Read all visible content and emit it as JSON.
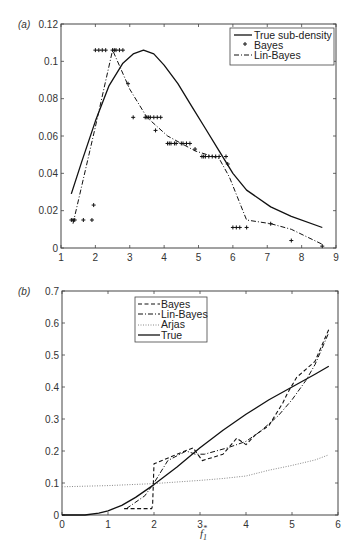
{
  "chart_data": [
    {
      "panel": "(a)",
      "type": "line",
      "title": "",
      "xlabel": "",
      "ylabel": "",
      "xlim": [
        1,
        9
      ],
      "ylim": [
        0,
        0.12
      ],
      "xticks": [
        "1",
        "2",
        "3",
        "4",
        "5",
        "6",
        "7",
        "8",
        "9"
      ],
      "yticks": [
        "0",
        "0.02",
        "0.04",
        "0.06",
        "0.08",
        "0.1",
        "0.12"
      ],
      "grid": false,
      "legend_position": "upper right",
      "legend": [
        "True sub-density",
        "Bayes",
        "Lin-Bayes"
      ],
      "series": [
        {
          "name": "True sub-density",
          "style": "solid",
          "x": [
            1.3,
            1.6,
            2.0,
            2.4,
            2.8,
            3.1,
            3.4,
            3.7,
            4.0,
            4.4,
            4.8,
            5.2,
            5.6,
            6.0,
            6.4,
            7.1,
            7.7,
            8.6
          ],
          "y": [
            0.029,
            0.046,
            0.068,
            0.087,
            0.099,
            0.104,
            0.106,
            0.104,
            0.098,
            0.088,
            0.076,
            0.064,
            0.052,
            0.04,
            0.031,
            0.022,
            0.017,
            0.011
          ]
        },
        {
          "name": "Bayes",
          "style": "markers-plus",
          "x": [
            1.3,
            1.35,
            1.4,
            1.65,
            1.9,
            1.95,
            2.0,
            2.1,
            2.2,
            2.3,
            2.5,
            2.55,
            2.6,
            2.7,
            2.8,
            2.95,
            3.1,
            3.45,
            3.5,
            3.55,
            3.6,
            3.7,
            3.8,
            3.9,
            3.75,
            4.1,
            4.15,
            4.2,
            4.3,
            4.35,
            4.5,
            4.55,
            4.65,
            4.75,
            4.9,
            5.1,
            5.15,
            5.2,
            5.3,
            5.4,
            5.5,
            5.6,
            5.8,
            5.85,
            6.0,
            6.1,
            6.2,
            6.4,
            7.1,
            7.7,
            8.6
          ],
          "y": [
            0.015,
            0.015,
            0.015,
            0.015,
            0.015,
            0.023,
            0.106,
            0.106,
            0.106,
            0.106,
            0.106,
            0.106,
            0.106,
            0.106,
            0.106,
            0.088,
            0.07,
            0.07,
            0.07,
            0.07,
            0.07,
            0.07,
            0.07,
            0.07,
            0.063,
            0.056,
            0.056,
            0.056,
            0.056,
            0.056,
            0.056,
            0.056,
            0.056,
            0.056,
            0.053,
            0.049,
            0.049,
            0.049,
            0.049,
            0.049,
            0.049,
            0.049,
            0.049,
            0.045,
            0.011,
            0.011,
            0.011,
            0.011,
            0.013,
            0.004,
            0.001
          ]
        },
        {
          "name": "Lin-Bayes",
          "style": "dash-dot",
          "x": [
            1.35,
            2.0,
            2.5,
            3.0,
            3.5,
            4.1,
            4.9,
            5.6,
            5.9,
            6.4,
            7.1,
            7.7,
            8.6
          ],
          "y": [
            0.013,
            0.065,
            0.106,
            0.085,
            0.07,
            0.06,
            0.052,
            0.048,
            0.038,
            0.015,
            0.013,
            0.01,
            0.002
          ]
        }
      ]
    },
    {
      "panel": "(b)",
      "type": "line",
      "title": "",
      "xlabel": "f1*",
      "ylabel": "",
      "xlim": [
        0,
        6
      ],
      "ylim": [
        0,
        0.7
      ],
      "xticks": [
        "0",
        "1",
        "2",
        "3",
        "4",
        "5",
        "6"
      ],
      "yticks": [
        "0",
        "0.1",
        "0.2",
        "0.3",
        "0.4",
        "0.5",
        "0.6",
        "0.7"
      ],
      "grid": false,
      "legend_position": "upper left",
      "legend": [
        "Bayes",
        "Lin-Bayes",
        "Arjas",
        "True"
      ],
      "series": [
        {
          "name": "Bayes",
          "style": "dashed",
          "x": [
            1.35,
            1.95,
            1.97,
            2.0,
            2.5,
            2.85,
            3.0,
            3.05,
            3.5,
            3.8,
            4.0,
            4.2,
            4.5,
            4.8,
            4.9,
            5.1,
            5.5,
            5.8
          ],
          "y": [
            0.02,
            0.02,
            0.03,
            0.16,
            0.19,
            0.21,
            0.18,
            0.17,
            0.19,
            0.24,
            0.22,
            0.25,
            0.28,
            0.35,
            0.38,
            0.43,
            0.48,
            0.58
          ]
        },
        {
          "name": "Lin-Bayes",
          "style": "dash-dot",
          "x": [
            1.4,
            1.8,
            2.0,
            2.3,
            2.7,
            2.9,
            3.1,
            3.6,
            4.0,
            4.3,
            4.7,
            5.0,
            5.3,
            5.5,
            5.8
          ],
          "y": [
            0.02,
            0.06,
            0.1,
            0.17,
            0.2,
            0.19,
            0.19,
            0.21,
            0.23,
            0.26,
            0.31,
            0.36,
            0.42,
            0.47,
            0.57
          ]
        },
        {
          "name": "Arjas",
          "style": "dotted",
          "x": [
            0.0,
            0.5,
            1.0,
            1.5,
            2.0,
            2.5,
            3.0,
            3.5,
            4.0,
            4.5,
            5.0,
            5.5,
            5.8
          ],
          "y": [
            0.088,
            0.09,
            0.092,
            0.095,
            0.098,
            0.103,
            0.108,
            0.114,
            0.122,
            0.14,
            0.155,
            0.172,
            0.188
          ]
        },
        {
          "name": "True",
          "style": "solid",
          "x": [
            0.0,
            0.5,
            0.8,
            1.0,
            1.3,
            1.6,
            2.0,
            2.5,
            3.0,
            3.5,
            4.0,
            4.5,
            5.0,
            5.5,
            5.8
          ],
          "y": [
            0.0,
            0.0,
            0.006,
            0.013,
            0.03,
            0.055,
            0.095,
            0.15,
            0.21,
            0.265,
            0.315,
            0.36,
            0.4,
            0.44,
            0.465
          ]
        }
      ]
    }
  ],
  "panels": {
    "a": {
      "label": "(a)",
      "legend": [
        {
          "label": "True sub-density"
        },
        {
          "label": "Bayes"
        },
        {
          "label": "Lin-Bayes"
        }
      ]
    },
    "b": {
      "label": "(b)",
      "xlabel_main": "f",
      "xlabel_sub": "1",
      "xlabel_sup": "*",
      "legend": [
        {
          "label": "Bayes"
        },
        {
          "label": "Lin-Bayes"
        },
        {
          "label": "Arjas"
        },
        {
          "label": "True"
        }
      ]
    }
  },
  "colors": {
    "axis": "#444444",
    "line": "#111111",
    "dotted": "#888888"
  }
}
